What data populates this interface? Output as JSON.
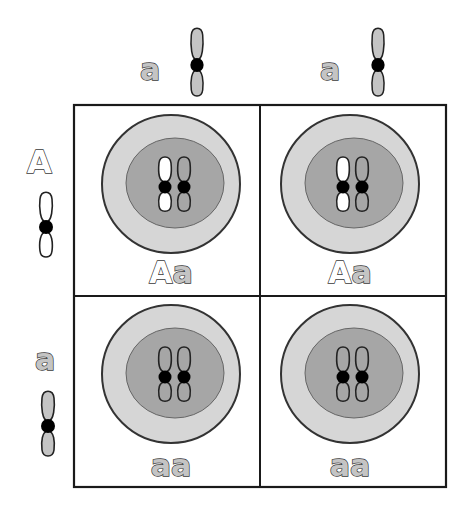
{
  "diagram": {
    "type": "punnett-square",
    "colors": {
      "grid_line": "#1a1a1a",
      "cytoplasm": "#d6d6d6",
      "nucleus": "#a6a6a6",
      "dominant_allele_fill": "#ffffff",
      "recessive_allele_fill": "#c4c4c4",
      "centromere": "#000000",
      "outline": "#333333"
    },
    "top_alleles": [
      {
        "label": "a",
        "type": "recessive"
      },
      {
        "label": "a",
        "type": "recessive"
      }
    ],
    "left_alleles": [
      {
        "label": "A",
        "type": "dominant"
      },
      {
        "label": "a",
        "type": "recessive"
      }
    ],
    "cells": [
      {
        "row": 0,
        "col": 0,
        "genotype_first": "A",
        "genotype_second": "a",
        "genotype": "Aa"
      },
      {
        "row": 0,
        "col": 1,
        "genotype_first": "A",
        "genotype_second": "a",
        "genotype": "Aa"
      },
      {
        "row": 1,
        "col": 0,
        "genotype_first": "a",
        "genotype_second": "a",
        "genotype": "aa"
      },
      {
        "row": 1,
        "col": 1,
        "genotype_first": "a",
        "genotype_second": "a",
        "genotype": "aa"
      }
    ]
  }
}
